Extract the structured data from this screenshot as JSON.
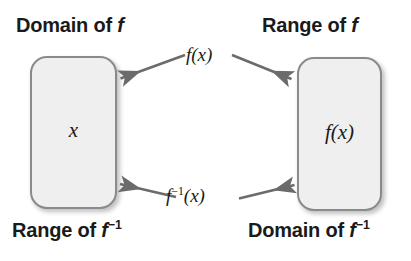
{
  "diagram": {
    "type": "mapping-diagram",
    "background_color": "#ffffff",
    "box_fill_color": "#efefef",
    "box_border_color": "#8a8a8a",
    "arrow_color": "#6b6b6b",
    "text_color": "#1a1a1a"
  },
  "labels": {
    "top_left": {
      "prefix": "Domain of ",
      "variable": "f",
      "superscript": "",
      "full_text": "Domain of f"
    },
    "top_right": {
      "prefix": "Range of ",
      "variable": "f",
      "superscript": "",
      "full_text": "Range of f"
    },
    "bottom_left": {
      "prefix": "Range of ",
      "variable": "f",
      "superscript": "−1",
      "full_text": "Range of f−1"
    },
    "bottom_right": {
      "prefix": "Domain of ",
      "variable": "f",
      "superscript": "−1",
      "full_text": "Domain of f−1"
    }
  },
  "boxes": {
    "left": {
      "name": "domain-set-box",
      "content": "x"
    },
    "right": {
      "name": "range-set-box",
      "content": "f(x)"
    }
  },
  "arrows": {
    "top": {
      "label_prefix": "f",
      "label_superscript": "",
      "label_suffix": "(x)",
      "full_text": "f(x)",
      "direction": "both",
      "description": "forward mapping from domain to range"
    },
    "bottom": {
      "label_prefix": "f",
      "label_superscript": "−1",
      "label_suffix": "(x)",
      "full_text": "f−1(x)",
      "direction": "both",
      "description": "inverse mapping from range back to domain"
    }
  }
}
